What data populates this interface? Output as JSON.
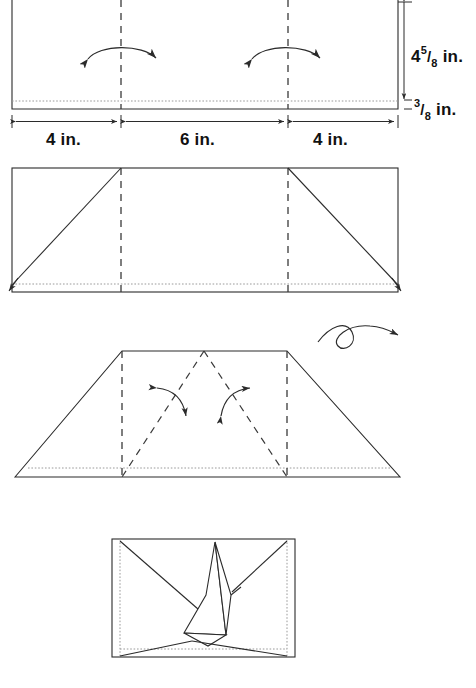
{
  "diagram": {
    "ink_color": "#2b2b2b",
    "dotted_color": "#9a9a9a",
    "background": "#ffffff"
  },
  "measurements": {
    "height_main_whole": "4",
    "height_main_num": "5",
    "height_main_den": "8",
    "height_main_unit": "in.",
    "flap_num": "3",
    "flap_den": "8",
    "flap_unit": "in.",
    "segment_left": "4 in.",
    "segment_center": "6 in.",
    "segment_right": "4 in."
  },
  "panels": [
    {
      "id": "step-1",
      "name": "step-1-rectangle-with-fold-lines",
      "description": "Rectangle with two vertical dashed fold lines, dotted bottom hem line, two double-headed curved fold arrows, and dimension callouts"
    },
    {
      "id": "step-2",
      "name": "step-2-diagonal-folds",
      "description": "Rectangle with diagonal solid lines from bottom corners up to the fold lines at the top edge, dotted hem, small corner arrows"
    },
    {
      "id": "step-3",
      "name": "step-3-trapezoid",
      "description": "Trapezoid formed by folded corners with dashed vertical fold lines, dashed V lines from top centre, two curved arrows and a flip-over loop arrow"
    },
    {
      "id": "step-4",
      "name": "step-4-final-folded-shape",
      "description": "Final folded paper shape with overlapping creased facets inside a rectangle with dotted side and bottom hem lines"
    }
  ],
  "icons": {
    "fold_arrow": "double-headed-curved-arrow",
    "flip_arrow": "flip-over-loop-arrow",
    "corner_arrow": "small-corner-arrow",
    "dimension_arrow": "double-headed-dimension-arrow"
  }
}
